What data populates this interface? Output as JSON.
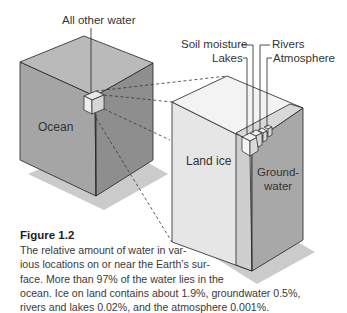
{
  "figure": {
    "labels": {
      "all_other_water": "All other water",
      "ocean": "Ocean",
      "land_ice": "Land ice",
      "groundwater_line1": "Ground-",
      "groundwater_line2": "water",
      "soil_moisture": "Soil moisture",
      "lakes": "Lakes",
      "rivers": "Rivers",
      "atmosphere": "Atmosphere"
    },
    "caption": {
      "title": "Figure 1.2",
      "lines": [
        "The relative amount of water in var-",
        "ious locations on or near the Earth’s sur-",
        "face. More than 97% of the water lies in the",
        "ocean. Ice on land contains about 1.9%, groundwater 0.5%,",
        "rivers and lakes 0.02%, and the atmosphere 0.001%."
      ]
    },
    "water_distribution": [
      {
        "location": "Ocean",
        "percent": "more than 97%"
      },
      {
        "location": "Land ice",
        "percent": "about 1.9%"
      },
      {
        "location": "Groundwater",
        "percent": "0.5%"
      },
      {
        "location": "Rivers and lakes",
        "percent": "0.02%"
      },
      {
        "location": "Atmosphere",
        "percent": "0.001%"
      }
    ],
    "colors": {
      "shadow": "#c9c9c9",
      "ocean_top": "#b8b8b8",
      "ocean_left": "#a3a3a3",
      "ocean_right": "#8f8f8f",
      "land_top": "#f2f2f2",
      "land_left": "#e4e4e4",
      "ground_face": "#a7a7a7",
      "ice_strip": "#cdcdcd"
    }
  }
}
